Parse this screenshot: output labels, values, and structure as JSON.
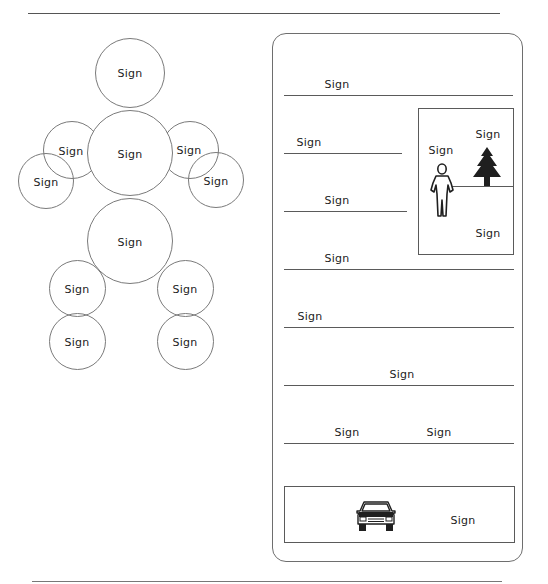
{
  "diagram": {
    "body_map": {
      "head": {
        "label": "Sign"
      },
      "torso": {
        "label": "Sign"
      },
      "left_upper_arm": {
        "label": "Sign"
      },
      "left_lower_arm": {
        "label": "Sign"
      },
      "right_upper_arm": {
        "label": "Sign"
      },
      "right_lower_arm": {
        "label": "Sign"
      },
      "hip": {
        "label": "Sign"
      },
      "left_upper_leg": {
        "label": "Sign"
      },
      "left_lower_leg": {
        "label": "Sign"
      },
      "right_upper_leg": {
        "label": "Sign"
      },
      "right_lower_leg": {
        "label": "Sign"
      }
    },
    "panel": {
      "lines": [
        {
          "label": "Sign"
        },
        {
          "label": "Sign"
        },
        {
          "label": "Sign"
        },
        {
          "label": "Sign"
        },
        {
          "label": "Sign"
        },
        {
          "label": "Sign"
        },
        {
          "labels": [
            "Sign",
            "Sign"
          ]
        }
      ],
      "scene_box": {
        "person_label": "Sign",
        "tree_label": "Sign",
        "ground_label": "Sign",
        "icons": [
          "person-icon",
          "tree-icon"
        ]
      },
      "vehicle_box": {
        "label": "Sign",
        "icon": "car-icon"
      }
    },
    "colors": {
      "stroke": "#6e6e6e",
      "icon_fill": "#1f1f1f",
      "text": "#222222"
    }
  }
}
